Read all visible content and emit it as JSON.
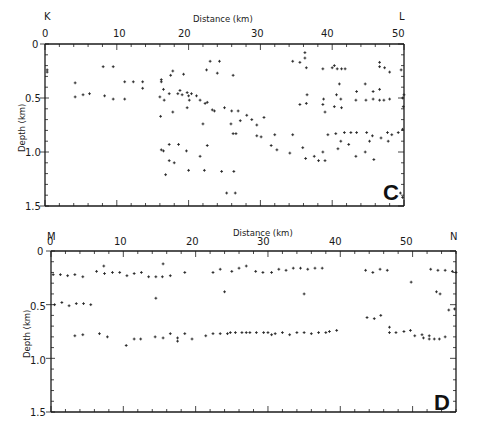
{
  "chart_data": [
    {
      "type": "scatter",
      "panel": "C",
      "title": "",
      "xlabel": "Distance (km)",
      "ylabel": "Depth (km)",
      "endpoint_left": "K",
      "endpoint_right": "L",
      "xlim": [
        0,
        50
      ],
      "ylim": [
        0,
        1.5
      ],
      "y_inverted": true,
      "xticks": [
        0,
        10,
        20,
        30,
        40,
        50
      ],
      "yticks": [
        0,
        0.5,
        1.0,
        1.5
      ],
      "ytick_labels": [
        "0",
        "0.5",
        "1.0",
        "1.5"
      ],
      "grid": false,
      "plot_box": {
        "x0": 45,
        "y0": 44,
        "x1": 404,
        "y1": 206
      },
      "points": [
        [
          0.3,
          0.24
        ],
        [
          0.3,
          0.26
        ],
        [
          8.1,
          0.21
        ],
        [
          9.5,
          0.21
        ],
        [
          4.2,
          0.36
        ],
        [
          11.1,
          0.35
        ],
        [
          12.3,
          0.35
        ],
        [
          13.6,
          0.35
        ],
        [
          13.6,
          0.41
        ],
        [
          4.2,
          0.49
        ],
        [
          5.3,
          0.47
        ],
        [
          6.2,
          0.46
        ],
        [
          8.3,
          0.48
        ],
        [
          9.5,
          0.51
        ],
        [
          11.1,
          0.51
        ],
        [
          16.2,
          0.35
        ],
        [
          16.2,
          0.33
        ],
        [
          16.5,
          0.42
        ],
        [
          17.5,
          0.29
        ],
        [
          17.8,
          0.25
        ],
        [
          18.5,
          0.46
        ],
        [
          19.1,
          0.47
        ],
        [
          16.0,
          0.49
        ],
        [
          16.6,
          0.52
        ],
        [
          19.3,
          0.28
        ],
        [
          18.8,
          0.43
        ],
        [
          19.8,
          0.45
        ],
        [
          20.0,
          0.48
        ],
        [
          20.4,
          0.46
        ],
        [
          21.1,
          0.48
        ],
        [
          21.6,
          0.52
        ],
        [
          22.3,
          0.55
        ],
        [
          22.6,
          0.54
        ],
        [
          20.1,
          0.52
        ],
        [
          17.3,
          0.46
        ],
        [
          22.5,
          0.24
        ],
        [
          23.0,
          0.16
        ],
        [
          24.3,
          0.16
        ],
        [
          24.0,
          0.27
        ],
        [
          26.2,
          0.29
        ],
        [
          23.3,
          0.61
        ],
        [
          23.6,
          0.62
        ],
        [
          25.0,
          0.59
        ],
        [
          26.0,
          0.62
        ],
        [
          26.9,
          0.62
        ],
        [
          16.1,
          0.67
        ],
        [
          17.8,
          0.63
        ],
        [
          19.8,
          0.59
        ],
        [
          22.0,
          0.74
        ],
        [
          27.2,
          0.71
        ],
        [
          28.1,
          0.66
        ],
        [
          25.9,
          0.74
        ],
        [
          26.2,
          0.83
        ],
        [
          30.5,
          0.68
        ],
        [
          28.8,
          0.7
        ],
        [
          16.2,
          0.98
        ],
        [
          16.5,
          0.99
        ],
        [
          17.3,
          0.93
        ],
        [
          18.6,
          0.93
        ],
        [
          19.7,
          0.99
        ],
        [
          17.3,
          1.08
        ],
        [
          18.0,
          1.1
        ],
        [
          21.6,
          1.04
        ],
        [
          24.6,
          1.18
        ],
        [
          26.3,
          1.18
        ],
        [
          22.6,
          0.94
        ],
        [
          29.5,
          0.85
        ],
        [
          30.1,
          0.86
        ],
        [
          32.0,
          0.84
        ],
        [
          16.8,
          1.21
        ],
        [
          20.0,
          1.17
        ],
        [
          22.2,
          1.17
        ],
        [
          25.3,
          1.38
        ],
        [
          26.5,
          1.38
        ],
        [
          26.6,
          0.83
        ],
        [
          29.5,
          0.75
        ],
        [
          31.5,
          0.94
        ],
        [
          34.5,
          0.84
        ],
        [
          35.9,
          0.96
        ],
        [
          38.1,
          1.08
        ],
        [
          34.5,
          0.16
        ],
        [
          35.5,
          0.17
        ],
        [
          36.2,
          0.08
        ],
        [
          36.2,
          0.13
        ],
        [
          36.4,
          0.22
        ],
        [
          38.7,
          0.23
        ],
        [
          41.8,
          0.23
        ],
        [
          41.3,
          0.23
        ],
        [
          40.7,
          0.23
        ],
        [
          40.3,
          0.2
        ],
        [
          40.0,
          0.22
        ],
        [
          35.5,
          0.56
        ],
        [
          36.4,
          0.55
        ],
        [
          36.5,
          0.47
        ],
        [
          38.8,
          0.51
        ],
        [
          41.2,
          0.51
        ],
        [
          40.6,
          0.47
        ],
        [
          43.3,
          0.52
        ],
        [
          44.7,
          0.52
        ],
        [
          45.7,
          0.51
        ],
        [
          46.6,
          0.52
        ],
        [
          47.2,
          0.52
        ],
        [
          48.0,
          0.51
        ],
        [
          38.7,
          0.56
        ],
        [
          41.3,
          0.59
        ],
        [
          40.3,
          0.58
        ],
        [
          39.0,
          0.63
        ],
        [
          46.6,
          0.42
        ],
        [
          45.7,
          0.44
        ],
        [
          43.4,
          0.44
        ],
        [
          44.6,
          0.37
        ],
        [
          41.0,
          0.37
        ],
        [
          46.6,
          0.17
        ],
        [
          47.3,
          0.22
        ],
        [
          46.6,
          0.21
        ],
        [
          48.0,
          0.26
        ],
        [
          39.4,
          0.84
        ],
        [
          40.5,
          0.83
        ],
        [
          41.7,
          0.82
        ],
        [
          42.6,
          0.82
        ],
        [
          43.4,
          0.82
        ],
        [
          44.8,
          0.82
        ],
        [
          45.6,
          0.85
        ],
        [
          46.8,
          0.87
        ],
        [
          47.7,
          0.82
        ],
        [
          48.3,
          0.84
        ],
        [
          49.2,
          0.82
        ],
        [
          49.8,
          0.79
        ],
        [
          41.2,
          0.9
        ],
        [
          42.3,
          0.93
        ],
        [
          45.2,
          0.9
        ],
        [
          47.8,
          0.9
        ],
        [
          40.8,
          0.97
        ],
        [
          38.7,
          1.0
        ],
        [
          37.5,
          1.04
        ],
        [
          36.3,
          1.06
        ],
        [
          34.1,
          1.01
        ],
        [
          32.3,
          0.98
        ],
        [
          44.6,
          1.0
        ],
        [
          43.3,
          1.04
        ],
        [
          45.8,
          1.07
        ],
        [
          39.0,
          1.08
        ],
        [
          49.6,
          0.24
        ],
        [
          49.8,
          0.5
        ],
        [
          50.0,
          0.47
        ],
        [
          49.9,
          0.58
        ],
        [
          49.5,
          1.38
        ],
        [
          49.8,
          1.42
        ]
      ]
    },
    {
      "type": "scatter",
      "panel": "D",
      "title": "",
      "xlabel": "Distance (km)",
      "ylabel": "Depth (km)",
      "endpoint_left": "M",
      "endpoint_right": "N",
      "xlim": [
        0,
        56
      ],
      "ylim": [
        0,
        1.5
      ],
      "y_inverted": true,
      "xticks": [
        0,
        10,
        20,
        30,
        40,
        50
      ],
      "yticks": [
        0,
        0.5,
        1.0,
        1.5
      ],
      "ytick_labels": [
        "0",
        "0.5",
        "1.0",
        "1.5"
      ],
      "grid": false,
      "plot_box": {
        "x0": 51,
        "y0": 251,
        "x1": 456,
        "y1": 412
      },
      "points": [
        [
          0.3,
          0.22
        ],
        [
          1.3,
          0.22
        ],
        [
          2.3,
          0.23
        ],
        [
          3.3,
          0.22
        ],
        [
          4.4,
          0.24
        ],
        [
          6.3,
          0.19
        ],
        [
          7.3,
          0.14
        ],
        [
          7.4,
          0.21
        ],
        [
          8.5,
          0.2
        ],
        [
          9.5,
          0.2
        ],
        [
          10.5,
          0.23
        ],
        [
          11.5,
          0.21
        ],
        [
          12.5,
          0.2
        ],
        [
          13.5,
          0.24
        ],
        [
          14.5,
          0.24
        ],
        [
          15.4,
          0.24
        ],
        [
          15.5,
          0.12
        ],
        [
          16.5,
          0.23
        ],
        [
          18.5,
          0.2
        ],
        [
          14.5,
          0.44
        ],
        [
          0.5,
          0.5
        ],
        [
          1.5,
          0.48
        ],
        [
          2.5,
          0.51
        ],
        [
          3.5,
          0.49
        ],
        [
          4.5,
          0.49
        ],
        [
          5.5,
          0.5
        ],
        [
          3.3,
          0.79
        ],
        [
          4.4,
          0.78
        ],
        [
          6.7,
          0.77
        ],
        [
          7.8,
          0.8
        ],
        [
          10.4,
          0.88
        ],
        [
          11.5,
          0.82
        ],
        [
          12.4,
          0.82
        ],
        [
          14.4,
          0.8
        ],
        [
          15.5,
          0.81
        ],
        [
          16.5,
          0.77
        ],
        [
          17.5,
          0.81
        ],
        [
          17.5,
          0.84
        ],
        [
          18.5,
          0.77
        ],
        [
          19.5,
          0.82
        ],
        [
          21.4,
          0.79
        ],
        [
          22.4,
          0.77
        ],
        [
          23.4,
          0.77
        ],
        [
          24.4,
          0.77
        ],
        [
          24.8,
          0.76
        ],
        [
          25.5,
          0.76
        ],
        [
          26.4,
          0.76
        ],
        [
          27.0,
          0.76
        ],
        [
          27.5,
          0.76
        ],
        [
          28.4,
          0.76
        ],
        [
          29.4,
          0.76
        ],
        [
          30.0,
          0.76
        ],
        [
          22.4,
          0.2
        ],
        [
          23.4,
          0.17
        ],
        [
          24.0,
          0.38
        ],
        [
          25.0,
          0.19
        ],
        [
          26.0,
          0.16
        ],
        [
          27.0,
          0.14
        ],
        [
          28.3,
          0.19
        ],
        [
          29.3,
          0.2
        ],
        [
          30.5,
          0.2
        ],
        [
          31.5,
          0.17
        ],
        [
          32.5,
          0.18
        ],
        [
          33.5,
          0.16
        ],
        [
          34.5,
          0.16
        ],
        [
          35.5,
          0.17
        ],
        [
          36.5,
          0.16
        ],
        [
          37.5,
          0.16
        ],
        [
          35.0,
          0.4
        ],
        [
          30.5,
          0.78
        ],
        [
          31.0,
          0.77
        ],
        [
          32.0,
          0.76
        ],
        [
          33.0,
          0.78
        ],
        [
          34.0,
          0.76
        ],
        [
          35.0,
          0.76
        ],
        [
          36.0,
          0.77
        ],
        [
          37.0,
          0.76
        ],
        [
          38.0,
          0.76
        ],
        [
          38.5,
          0.75
        ],
        [
          39.5,
          0.74
        ],
        [
          43.5,
          0.18
        ],
        [
          44.5,
          0.2
        ],
        [
          45.5,
          0.17
        ],
        [
          46.5,
          0.18
        ],
        [
          49.8,
          0.29
        ],
        [
          52.5,
          0.17
        ],
        [
          53.5,
          0.18
        ],
        [
          54.5,
          0.18
        ],
        [
          55.5,
          0.19
        ],
        [
          56.0,
          0.2
        ],
        [
          53.3,
          0.38
        ],
        [
          53.8,
          0.4
        ],
        [
          55.0,
          0.55
        ],
        [
          55.8,
          0.54
        ],
        [
          43.7,
          0.62
        ],
        [
          44.7,
          0.63
        ],
        [
          45.6,
          0.6
        ],
        [
          46.8,
          0.71
        ],
        [
          46.8,
          0.76
        ],
        [
          47.7,
          0.76
        ],
        [
          48.8,
          0.75
        ],
        [
          49.7,
          0.74
        ],
        [
          50.3,
          0.79
        ],
        [
          51.3,
          0.78
        ],
        [
          51.5,
          0.81
        ],
        [
          52.3,
          0.79
        ],
        [
          52.3,
          0.82
        ],
        [
          53.0,
          0.82
        ],
        [
          53.7,
          0.82
        ],
        [
          54.5,
          0.8
        ]
      ]
    }
  ],
  "panels": {
    "c": {
      "axis_title": "Distance (km)",
      "y_title": "Depth (km)",
      "left_end": "K",
      "right_end": "L",
      "letter": "C",
      "xtick_labels": [
        "0",
        "10",
        "20",
        "30",
        "40",
        "50"
      ],
      "ytick_labels": [
        "0",
        "0.5",
        "1.0",
        "1.5"
      ]
    },
    "d": {
      "axis_title": "Distance (km)",
      "y_title": "Depth (km)",
      "left_end": "M",
      "right_end": "N",
      "letter": "D",
      "xtick_labels": [
        "0",
        "10",
        "20",
        "30",
        "40",
        "50"
      ],
      "ytick_labels": [
        "0",
        "0.5",
        "1.0",
        "1.5"
      ]
    }
  }
}
